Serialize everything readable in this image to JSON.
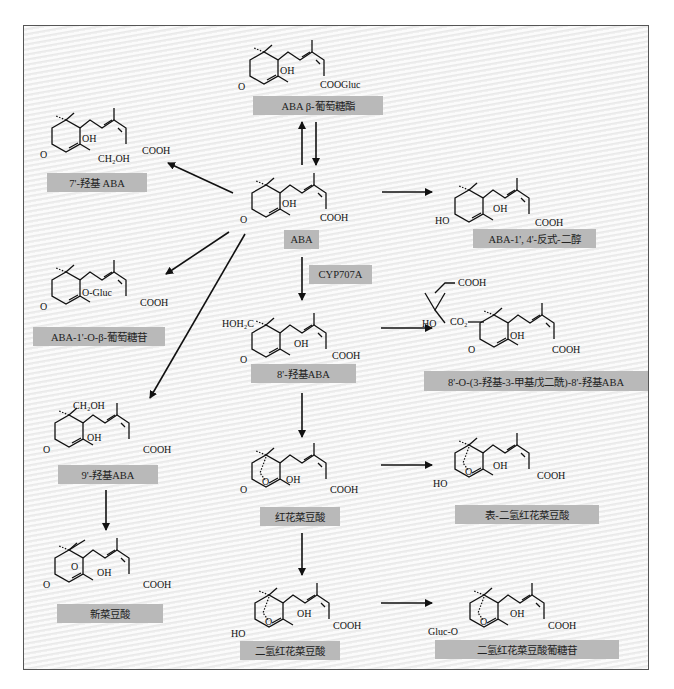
{
  "diagram": {
    "center_compound": "ABA",
    "enzyme_label": "CYP707A",
    "compounds": [
      {
        "id": "aba-glucosyl-ester",
        "label": "ABA β-葡萄糖酯",
        "substituent": "COOGluc"
      },
      {
        "id": "7-hydroxy-aba",
        "label": "7'-羟基 ABA",
        "substituents": [
          "OH",
          "CH₂OH",
          "COOH"
        ]
      },
      {
        "id": "aba",
        "label": "ABA",
        "substituents": [
          "OH",
          "COOH",
          "O"
        ]
      },
      {
        "id": "aba-diol",
        "label": "ABA-1', 4'-反式-二醇",
        "substituents": [
          "HO",
          "OH",
          "COOH"
        ]
      },
      {
        "id": "aba-glucoside",
        "label": "ABA-1'-O-β-葡萄糖苷",
        "substituents": [
          "O-Gluc",
          "COOH"
        ]
      },
      {
        "id": "8-hydroxy-aba",
        "label": "8'-羟基ABA",
        "substituents": [
          "HOH₂C",
          "OH",
          "COOH"
        ]
      },
      {
        "id": "hmg-8-hydroxy-aba",
        "label": "8'-O-(3-羟基-3-甲基戊二酰)-8'-羟基ABA",
        "substituents": [
          "COOH",
          "HO",
          "CO₂",
          "OH",
          "COOH"
        ]
      },
      {
        "id": "9-hydroxy-aba",
        "label": "9'-羟基ABA",
        "substituents": [
          "CH₂OH",
          "OH",
          "COOH"
        ]
      },
      {
        "id": "phaseic-acid",
        "label": "红花菜豆酸",
        "substituents": [
          "O",
          "OH",
          "COOH"
        ]
      },
      {
        "id": "epi-dihydrophaseic-acid",
        "label": "表-二氢红花菜豆酸",
        "substituents": [
          "HO",
          "O",
          "OH",
          "COOH"
        ]
      },
      {
        "id": "neophaseic-acid",
        "label": "新菜豆酸",
        "substituents": [
          "O",
          "OH",
          "COOH"
        ]
      },
      {
        "id": "dihydrophaseic-acid",
        "label": "二氢红花菜豆酸",
        "substituents": [
          "HO",
          "O",
          "OH",
          "COOH"
        ]
      },
      {
        "id": "dpa-glucoside",
        "label": "二氢红花菜豆酸葡糖苷",
        "substituents": [
          "Gluc-O",
          "O",
          "OH",
          "COOH"
        ]
      }
    ],
    "text": {
      "oh": "OH",
      "cooh": "COOH",
      "o": "O",
      "ho": "HO",
      "ch2oh": "CH₂OH",
      "hoh2c": "HOH₂C",
      "oglucs": "O-Gluc",
      "coogluc": "COOGluc",
      "co2": "CO₂",
      "glucO": "Gluc-O"
    },
    "edges": [
      {
        "from": "aba",
        "to": "aba-glucosyl-ester"
      },
      {
        "from": "aba-glucosyl-ester",
        "to": "aba"
      },
      {
        "from": "aba",
        "to": "7-hydroxy-aba"
      },
      {
        "from": "aba",
        "to": "aba-diol"
      },
      {
        "from": "aba",
        "to": "aba-glucoside"
      },
      {
        "from": "aba",
        "to": "9-hydroxy-aba"
      },
      {
        "from": "aba",
        "to": "8-hydroxy-aba",
        "enzyme": "CYP707A"
      },
      {
        "from": "8-hydroxy-aba",
        "to": "hmg-8-hydroxy-aba"
      },
      {
        "from": "8-hydroxy-aba",
        "to": "phaseic-acid"
      },
      {
        "from": "phaseic-acid",
        "to": "epi-dihydrophaseic-acid"
      },
      {
        "from": "phaseic-acid",
        "to": "dihydrophaseic-acid"
      },
      {
        "from": "dihydrophaseic-acid",
        "to": "dpa-glucoside"
      },
      {
        "from": "9-hydroxy-aba",
        "to": "neophaseic-acid"
      }
    ],
    "colors": {
      "label_bg": "#b9b9b9",
      "frame_border": "#555555",
      "background": "#efefef"
    }
  }
}
